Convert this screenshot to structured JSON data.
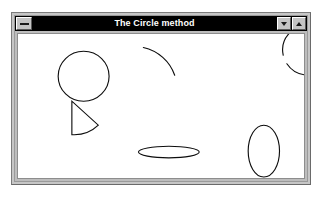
{
  "window": {
    "title": "The Circle method",
    "system_menu_icon": "window-menu-icon",
    "minimize_icon": "triangle-down-icon",
    "maximize_icon": "triangle-up-icon",
    "background_color": "#ffffff",
    "frame_color": "#c6c6c6",
    "titlebar_color": "#000000",
    "titlebar_text_color": "#ffffff",
    "client_color": "#ffffff"
  },
  "canvas": {
    "stroke_color": "#0d0d0d",
    "stroke_width": 1.15,
    "width": 292,
    "height": 150,
    "shapes": [
      {
        "name": "full-circle",
        "type": "circle",
        "cx": 67,
        "cy": 44,
        "r": 26,
        "path": "M 67 18 A 26 26 0 1 1 66.99 18 Z"
      },
      {
        "name": "quarter-arc",
        "type": "arc",
        "cx": 153,
        "cy": 60,
        "r": 32,
        "start_deg": 218,
        "end_deg": 272,
        "path": "M 152 16 A 34 34 0 0 1 181 37"
      },
      {
        "name": "open-c-arc",
        "type": "arc",
        "cx": 251,
        "cy": 38,
        "r": 26,
        "start_deg": 20,
        "end_deg": 340,
        "path": "M 274 29 A 26 26 0 1 0 271.5 22.5"
      },
      {
        "name": "pie-wedge",
        "type": "wedge",
        "cx": 61,
        "cy": 97,
        "r": 28,
        "start_deg": 0,
        "end_deg": 90,
        "path": "M 61 97 L 61 69 A 28 28 0 0 1 81 95 Z"
      },
      {
        "name": "flat-ellipse",
        "type": "ellipse",
        "cx": 154,
        "cy": 123,
        "rx": 31,
        "ry": 6
      },
      {
        "name": "tall-ellipse",
        "type": "ellipse",
        "cx": 251,
        "cy": 122,
        "rx": 16,
        "ry": 27
      }
    ]
  }
}
